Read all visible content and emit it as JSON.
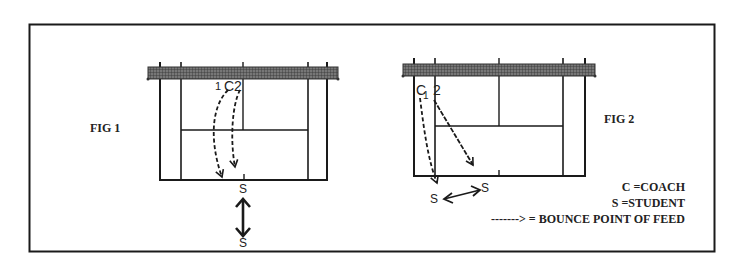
{
  "figures": [
    {
      "id": "fig1",
      "title": "FIG 1",
      "markers": {
        "positions": [
          "1",
          "C",
          "2"
        ],
        "students": [
          "S",
          "S"
        ]
      }
    },
    {
      "id": "fig2",
      "title": "FIG 2",
      "markers": {
        "positions": [
          "C",
          "1",
          "2"
        ],
        "students": [
          "S",
          "S"
        ]
      }
    }
  ],
  "legend": {
    "coach": "C =COACH",
    "student": "S =STUDENT",
    "bounce": "-------> = BOUNCE POINT OF FEED"
  },
  "colors": {
    "ink": "#1a1a1a",
    "net": "#555555",
    "paper": "#ffffff"
  }
}
